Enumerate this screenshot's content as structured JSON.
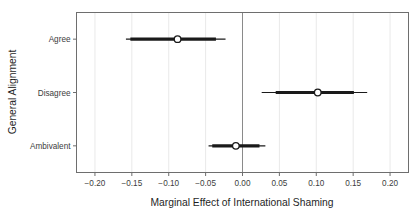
{
  "chart_data": {
    "type": "scatter",
    "subtype": "dot-and-whisker coefficient plot",
    "title": "",
    "xlabel": "Marginal Effect of International Shaming",
    "ylabel": "General Alignment",
    "orientation": "horizontal",
    "grid": true,
    "legend_position": "none",
    "reference_line": 0.0,
    "xlim": [
      -0.225,
      0.225
    ],
    "xticks": [
      -0.2,
      -0.15,
      -0.1,
      -0.05,
      0.0,
      0.05,
      0.1,
      0.15,
      0.2
    ],
    "xticklabels": [
      "−0.20",
      "−0.15",
      "−0.10",
      "−0.05",
      "0.00",
      "0.05",
      "0.10",
      "0.15",
      "0.20"
    ],
    "categories": [
      "Agree",
      "Disagree",
      "Ambivalent"
    ],
    "points": [
      {
        "category": "Agree",
        "estimate": -0.088,
        "ci_inner_low": -0.152,
        "ci_inner_high": -0.036,
        "ci_outer_low": -0.158,
        "ci_outer_high": -0.023
      },
      {
        "category": "Disagree",
        "estimate": 0.102,
        "ci_inner_low": 0.045,
        "ci_inner_high": 0.151,
        "ci_outer_low": 0.026,
        "ci_outer_high": 0.169
      },
      {
        "category": "Ambivalent",
        "estimate": -0.009,
        "ci_inner_low": -0.041,
        "ci_inner_high": 0.023,
        "ci_outer_low": -0.046,
        "ci_outer_high": 0.031
      }
    ],
    "colors": {
      "point_fill": "#ffffff",
      "point_stroke": "#1a1a1a",
      "interval": "#1a1a1a",
      "grid": "#e9e9e9",
      "frame": "#6e6e6e",
      "reference_line": "#8a8a8a",
      "background": "#ffffff",
      "text": "#3d3d3d"
    }
  }
}
